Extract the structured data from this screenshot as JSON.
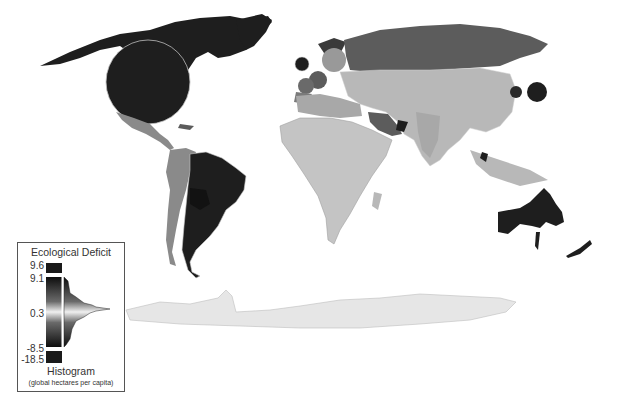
{
  "map": {
    "type": "cartogram",
    "subject": "Ecological Deficit by country",
    "colors": {
      "background": "#ffffff",
      "deficit_dark": "#1e1e1e",
      "high_mid": "#5c5c5c",
      "mid": "#8a8a8a",
      "light": "#b8b8b8",
      "lightest": "#d9d9d9",
      "antarctica": "#e6e6e6",
      "border": "#cfcfcf"
    }
  },
  "legend": {
    "title": "Ecological Deficit",
    "ticks": [
      "9.6",
      "9.1",
      "0.3",
      "-8.5",
      "-18.5"
    ],
    "subtitle": "Histogram",
    "unit": "(global hectares per capita)"
  }
}
